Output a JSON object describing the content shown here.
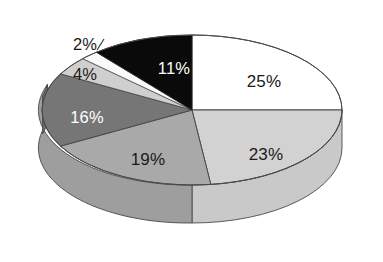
{
  "chart_data": {
    "type": "pie",
    "title": "",
    "subtitle": "",
    "xlabel": "",
    "ylabel": "",
    "legend": "none",
    "grid": false,
    "three_d": true,
    "start_angle_deg": 0,
    "direction": "clockwise",
    "categories": [
      "25%",
      "23%",
      "19%",
      "16%",
      "4%",
      "2%",
      "11%"
    ],
    "values": [
      25,
      23,
      19,
      16,
      4,
      2,
      11
    ],
    "total": 100,
    "slices": [
      {
        "label": "25%",
        "value": 25,
        "color": "#ffffff",
        "label_color": "#1a1a1a",
        "label_position": "inside"
      },
      {
        "label": "23%",
        "value": 23,
        "color": "#d2d2d2",
        "label_color": "#1a1a1a",
        "label_position": "inside"
      },
      {
        "label": "19%",
        "value": 19,
        "color": "#a9a9a9",
        "label_color": "#1a1a1a",
        "label_position": "inside"
      },
      {
        "label": "16%",
        "value": 16,
        "color": "#767676",
        "label_color": "#ffffff",
        "label_position": "inside"
      },
      {
        "label": "4%",
        "value": 4,
        "color": "#cfcfcf",
        "label_color": "#1a1a1a",
        "label_position": "outside"
      },
      {
        "label": "2%",
        "value": 2,
        "color": "#fafafa",
        "label_color": "#1a1a1a",
        "label_position": "outside"
      },
      {
        "label": "11%",
        "value": 11,
        "color": "#0a0a0a",
        "label_color": "#ffffff",
        "label_position": "inside"
      }
    ]
  },
  "chart": {
    "background_color": "#ffffff",
    "outline_color": "#4a4a4a",
    "labels": {
      "p25": "25%",
      "p23": "23%",
      "p19": "19%",
      "p16": "16%",
      "p4": "4%",
      "p2": "2%",
      "p11": "11%"
    }
  }
}
